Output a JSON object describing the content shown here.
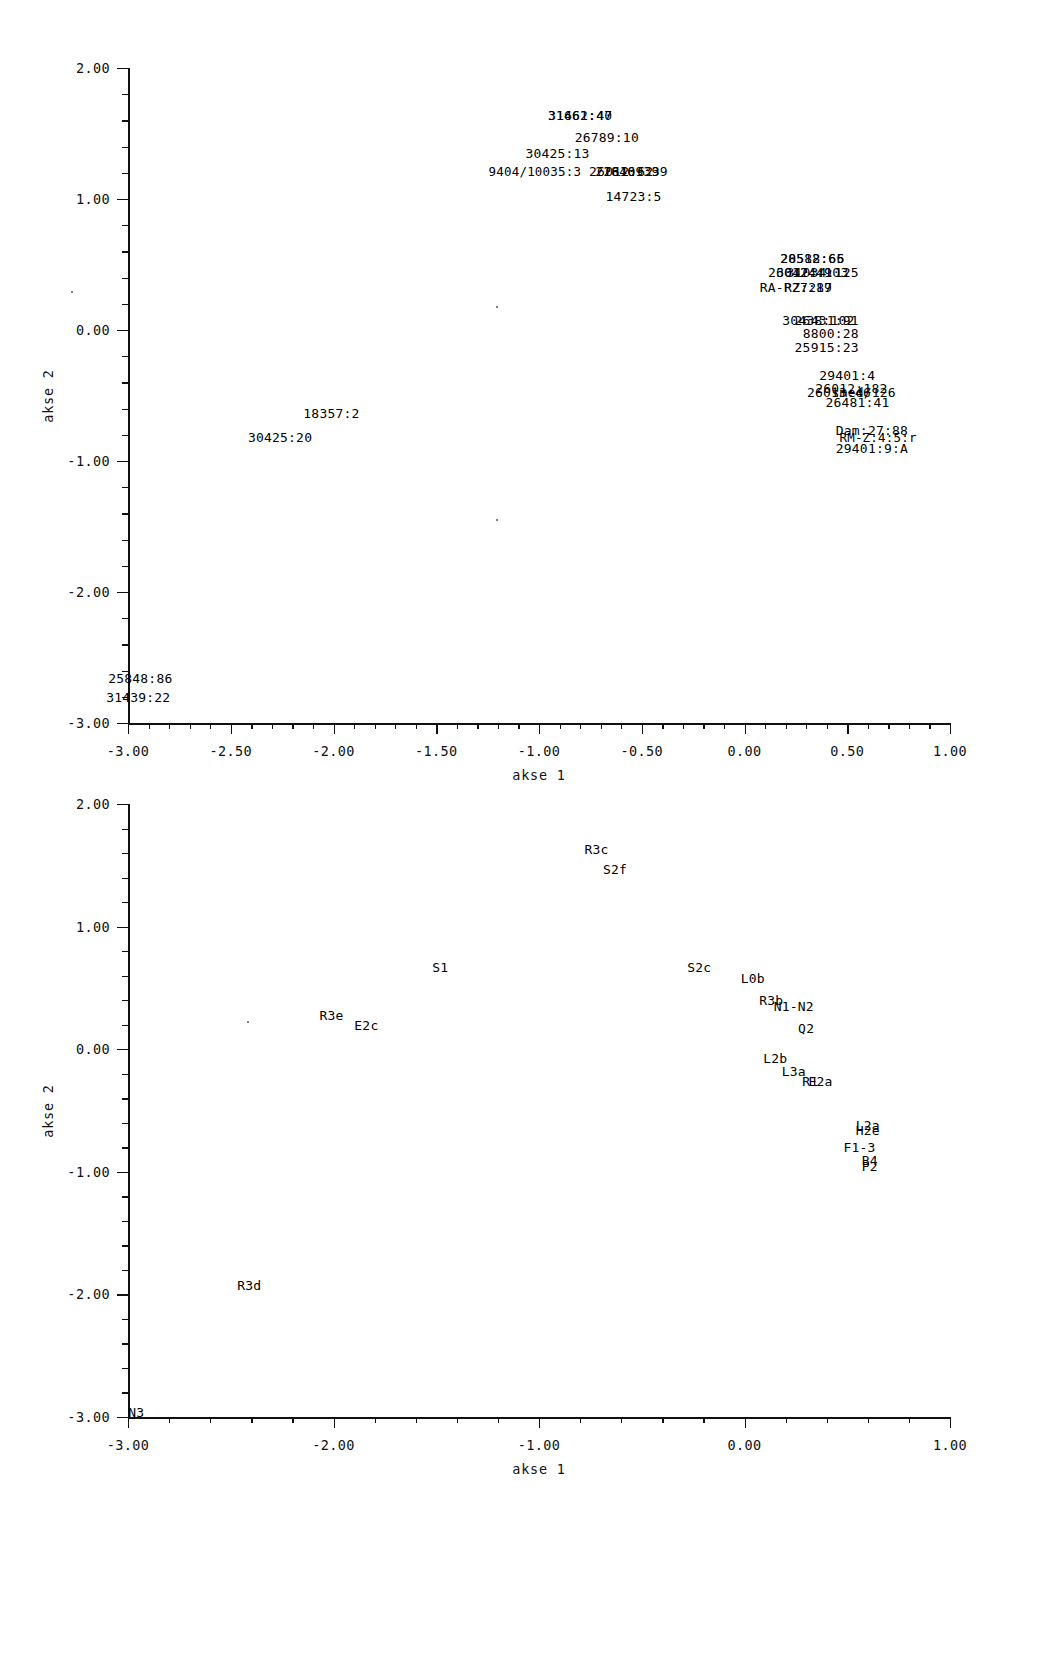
{
  "figure": {
    "background_color": "#ffffff",
    "text_color": "#111111"
  },
  "chart_data": [
    {
      "id": "top",
      "type": "scatter",
      "title": "",
      "xlabel": "akse 1",
      "ylabel": "akse 2",
      "xlim": [
        -3.0,
        1.0
      ],
      "ylim": [
        -3.0,
        2.0
      ],
      "xticks": [
        "-3.00",
        "-2.50",
        "-2.00",
        "-1.50",
        "-1.00",
        "-0.50",
        "0.00",
        "0.50",
        "1.00"
      ],
      "xtick_values": [
        -3.0,
        -2.5,
        -2.0,
        -1.5,
        -1.0,
        -0.5,
        0.0,
        0.5,
        1.0
      ],
      "yticks": [
        "2.00",
        "1.00",
        "0.00",
        "-1.00",
        "-2.00",
        "-3.00"
      ],
      "ytick_values": [
        2.0,
        1.0,
        0.0,
        -1.0,
        -2.0,
        -3.0
      ],
      "grid": false,
      "legend": "none",
      "minor_ticks_x": 5,
      "minor_ticks_y": 5,
      "points": [
        {
          "label": "31461:40",
          "x": -0.8,
          "y": 1.64
        },
        {
          "label": "31662:47",
          "x": -0.8,
          "y": 1.64
        },
        {
          "label": "26789:10",
          "x": -0.67,
          "y": 1.47
        },
        {
          "label": "30425:13",
          "x": -0.91,
          "y": 1.35
        },
        {
          "label": "9404/10035:3",
          "x": -1.02,
          "y": 1.21
        },
        {
          "label": "26012:62",
          "x": -0.6,
          "y": 1.21
        },
        {
          "label": "26109:39",
          "x": -0.53,
          "y": 1.21
        },
        {
          "label": "21846:39",
          "x": -0.57,
          "y": 1.21
        },
        {
          "label": "14723:5",
          "x": -0.54,
          "y": 1.02
        },
        {
          "label": "28588:65",
          "x": 0.33,
          "y": 0.55
        },
        {
          "label": "20512:66",
          "x": 0.33,
          "y": 0.55
        },
        {
          "label": "26012:49",
          "x": 0.27,
          "y": 0.44
        },
        {
          "label": "30424:103",
          "x": 0.33,
          "y": 0.44
        },
        {
          "label": "31034:125",
          "x": 0.38,
          "y": 0.44
        },
        {
          "label": "RA-P27:19",
          "x": 0.25,
          "y": 0.33
        },
        {
          "label": "RZ:287",
          "x": 0.31,
          "y": 0.33
        },
        {
          "label": "30438:102",
          "x": 0.36,
          "y": 0.08
        },
        {
          "label": "26431:91",
          "x": 0.4,
          "y": 0.08
        },
        {
          "label": "8800:28",
          "x": 0.42,
          "y": -0.02
        },
        {
          "label": "25915:23",
          "x": 0.4,
          "y": -0.13
        },
        {
          "label": "29401:4",
          "x": 0.5,
          "y": -0.34
        },
        {
          "label": "26012:182",
          "x": 0.52,
          "y": -0.44
        },
        {
          "label": "26013:46",
          "x": 0.46,
          "y": -0.47
        },
        {
          "label": "smed/126",
          "x": 0.58,
          "y": -0.47
        },
        {
          "label": "26481:41",
          "x": 0.55,
          "y": -0.55
        },
        {
          "label": "Dam:27:88",
          "x": 0.62,
          "y": -0.76
        },
        {
          "label": "RM-Z:4:5:r",
          "x": 0.65,
          "y": -0.82
        },
        {
          "label": "29401:9:A",
          "x": 0.62,
          "y": -0.9
        },
        {
          "label": "18357:2",
          "x": -2.01,
          "y": -0.63
        },
        {
          "label": "30425:20",
          "x": -2.26,
          "y": -0.82
        },
        {
          "label": "25848:86",
          "x": -2.94,
          "y": -2.66
        },
        {
          "label": "31439:22",
          "x": -2.95,
          "y": -2.8
        }
      ]
    },
    {
      "id": "bottom",
      "type": "scatter",
      "title": "",
      "xlabel": "akse 1",
      "ylabel": "akse 2",
      "xlim": [
        -3.0,
        1.0
      ],
      "ylim": [
        -3.0,
        2.0
      ],
      "xticks": [
        "-3.00",
        "-2.00",
        "-1.00",
        "0.00",
        "1.00"
      ],
      "xtick_values": [
        -3.0,
        -2.0,
        -1.0,
        0.0,
        1.0
      ],
      "yticks": [
        "2.00",
        "1.00",
        "0.00",
        "-1.00",
        "-2.00",
        "-3.00"
      ],
      "ytick_values": [
        2.0,
        1.0,
        0.0,
        -1.0,
        -2.0,
        -3.0
      ],
      "grid": false,
      "legend": "none",
      "minor_ticks_x": 5,
      "minor_ticks_y": 5,
      "points": [
        {
          "label": "R3c",
          "x": -0.72,
          "y": 1.63
        },
        {
          "label": "S2f",
          "x": -0.63,
          "y": 1.47
        },
        {
          "label": "S1",
          "x": -1.48,
          "y": 0.67
        },
        {
          "label": "S2c",
          "x": -0.22,
          "y": 0.67
        },
        {
          "label": "L0b",
          "x": 0.04,
          "y": 0.58
        },
        {
          "label": "R3b",
          "x": 0.13,
          "y": 0.4
        },
        {
          "label": "N1-N2",
          "x": 0.24,
          "y": 0.35
        },
        {
          "label": "R3e",
          "x": -2.01,
          "y": 0.28
        },
        {
          "label": "E2c",
          "x": -1.84,
          "y": 0.2
        },
        {
          "label": "Q2",
          "x": 0.3,
          "y": 0.17
        },
        {
          "label": "L2b",
          "x": 0.15,
          "y": -0.07
        },
        {
          "label": "L3a",
          "x": 0.24,
          "y": -0.18
        },
        {
          "label": "R1",
          "x": 0.32,
          "y": -0.26
        },
        {
          "label": "E2a",
          "x": 0.37,
          "y": -0.26
        },
        {
          "label": "L2a",
          "x": 0.6,
          "y": -0.62
        },
        {
          "label": "H2e",
          "x": 0.6,
          "y": -0.66
        },
        {
          "label": "F1-3",
          "x": 0.56,
          "y": -0.8
        },
        {
          "label": "B4",
          "x": 0.61,
          "y": -0.9
        },
        {
          "label": "P2",
          "x": 0.61,
          "y": -0.95
        },
        {
          "label": "R3d",
          "x": -2.41,
          "y": -1.92
        },
        {
          "label": "N3",
          "x": -2.96,
          "y": -2.96
        }
      ]
    }
  ]
}
